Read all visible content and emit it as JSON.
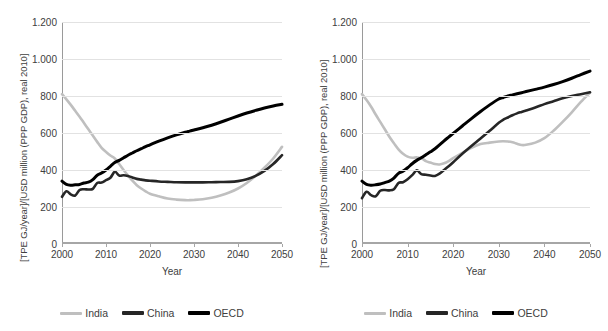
{
  "figure": {
    "panels": [
      {
        "id": "left",
        "name": "panel-baseline"
      },
      {
        "id": "right",
        "name": "panel-scenario"
      }
    ]
  },
  "axis": {
    "y_ticks": [
      "0",
      "200",
      "400",
      "600",
      "800",
      "1.000",
      "1.200"
    ],
    "x_ticks": [
      "2000",
      "2010",
      "2020",
      "2030",
      "2040",
      "2050"
    ],
    "x_title": "Year",
    "y_title": "[TPE GJ/year]/[USD million (PPP GDP), real 2010]"
  },
  "legend": {
    "items": [
      {
        "label": "India",
        "color": "#bfbfbf"
      },
      {
        "label": "China",
        "color": "#262626"
      },
      {
        "label": "OECD",
        "color": "#000000"
      }
    ]
  },
  "colors": {
    "india": "#bfbfbf",
    "china": "#262626",
    "oecd": "#000000",
    "grid": "#e2e2e2",
    "axis": "#a6a6a6",
    "text": "#404040"
  },
  "chart_data": [
    {
      "type": "line",
      "panel": "left",
      "title": "",
      "xlabel": "Year",
      "ylabel": "[TPE GJ/year]/[USD million (PPP GDP), real 2010]",
      "xlim": [
        2000,
        2050
      ],
      "ylim": [
        0,
        1200
      ],
      "ytick_step": 200,
      "grid": true,
      "legend_position": "bottom",
      "x": [
        2000,
        2001,
        2002,
        2003,
        2004,
        2005,
        2006,
        2007,
        2008,
        2009,
        2010,
        2011,
        2012,
        2013,
        2014,
        2015,
        2016,
        2017,
        2018,
        2019,
        2020,
        2022,
        2024,
        2026,
        2028,
        2029,
        2030,
        2032,
        2034,
        2036,
        2038,
        2040,
        2042,
        2044,
        2046,
        2048,
        2050
      ],
      "series": [
        {
          "name": "India",
          "color": "#bfbfbf",
          "values": [
            810,
            782,
            752,
            720,
            688,
            654,
            620,
            586,
            552,
            520,
            498,
            478,
            462,
            432,
            400,
            370,
            342,
            318,
            300,
            285,
            272,
            258,
            246,
            240,
            237,
            237,
            238,
            242,
            250,
            262,
            278,
            300,
            330,
            368,
            412,
            462,
            525
          ]
        },
        {
          "name": "China",
          "color": "#262626",
          "values": [
            255,
            285,
            268,
            262,
            292,
            296,
            295,
            298,
            330,
            332,
            345,
            358,
            390,
            370,
            372,
            368,
            360,
            352,
            348,
            344,
            342,
            338,
            336,
            334,
            333,
            333,
            333,
            333,
            334,
            335,
            336,
            340,
            350,
            368,
            395,
            432,
            480
          ]
        },
        {
          "name": "OECD",
          "color": "#000000",
          "values": [
            340,
            322,
            318,
            320,
            322,
            330,
            334,
            348,
            372,
            384,
            400,
            420,
            440,
            452,
            466,
            480,
            492,
            504,
            515,
            526,
            536,
            556,
            574,
            590,
            604,
            610,
            616,
            628,
            642,
            658,
            675,
            692,
            708,
            722,
            735,
            746,
            755
          ]
        }
      ]
    },
    {
      "type": "line",
      "panel": "right",
      "title": "",
      "xlabel": "Year",
      "ylabel": "[TPE GJ/year]/[USD million (PPP GDP), real 2010]",
      "xlim": [
        2000,
        2050
      ],
      "ylim": [
        0,
        1200
      ],
      "ytick_step": 200,
      "grid": true,
      "legend_position": "bottom",
      "x": [
        2000,
        2001,
        2002,
        2003,
        2004,
        2005,
        2006,
        2007,
        2008,
        2009,
        2010,
        2011,
        2012,
        2013,
        2014,
        2015,
        2016,
        2017,
        2018,
        2019,
        2020,
        2022,
        2024,
        2026,
        2028,
        2030,
        2031,
        2032,
        2033,
        2034,
        2035,
        2036,
        2038,
        2040,
        2042,
        2044,
        2046,
        2048,
        2050
      ],
      "series": [
        {
          "name": "India",
          "color": "#bfbfbf",
          "values": [
            810,
            778,
            742,
            700,
            660,
            620,
            580,
            545,
            512,
            488,
            472,
            466,
            468,
            465,
            448,
            440,
            432,
            430,
            436,
            448,
            464,
            492,
            520,
            540,
            548,
            554,
            555,
            554,
            550,
            542,
            535,
            536,
            548,
            572,
            612,
            660,
            712,
            768,
            818
          ]
        },
        {
          "name": "China",
          "color": "#262626",
          "values": [
            248,
            282,
            264,
            258,
            288,
            292,
            290,
            296,
            330,
            334,
            350,
            372,
            398,
            378,
            374,
            370,
            368,
            380,
            400,
            420,
            442,
            488,
            530,
            570,
            612,
            655,
            672,
            684,
            696,
            706,
            714,
            722,
            738,
            756,
            772,
            788,
            800,
            810,
            820
          ]
        },
        {
          "name": "OECD",
          "color": "#000000",
          "values": [
            340,
            322,
            318,
            320,
            324,
            332,
            340,
            356,
            382,
            394,
            412,
            434,
            452,
            466,
            482,
            498,
            515,
            536,
            558,
            578,
            598,
            638,
            678,
            716,
            752,
            784,
            792,
            800,
            806,
            812,
            818,
            824,
            836,
            848,
            862,
            878,
            896,
            916,
            935
          ]
        }
      ]
    }
  ]
}
